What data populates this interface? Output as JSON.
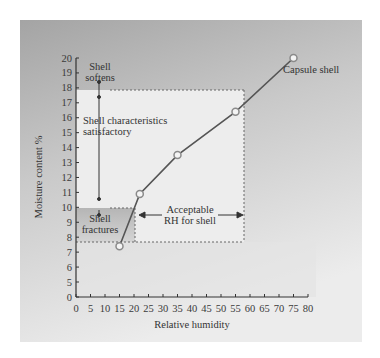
{
  "chart_data": {
    "type": "line",
    "title": "",
    "xlabel": "Relative humidity",
    "ylabel": "Moisture content %",
    "xlim": [
      0,
      80
    ],
    "ylim": [
      0,
      20
    ],
    "y_axis_break": "0 then 5-20",
    "x_ticks": [
      0,
      5,
      10,
      15,
      20,
      25,
      30,
      35,
      40,
      45,
      50,
      55,
      60,
      65,
      70,
      75,
      80
    ],
    "y_ticks": [
      0,
      5,
      6,
      7,
      8,
      9,
      10,
      11,
      12,
      13,
      14,
      15,
      16,
      17,
      18,
      19,
      20
    ],
    "grid": false,
    "series": [
      {
        "name": "Capsule shell",
        "x": [
          15,
          22,
          35,
          55,
          75
        ],
        "y": [
          7.4,
          10.9,
          13.5,
          16.4,
          20.0
        ]
      }
    ],
    "regions": [
      {
        "label": "Shell softens",
        "y_range": [
          17.8,
          20
        ]
      },
      {
        "label": "Shell characteristics satisfactory",
        "y_range": [
          10,
          17.8
        ]
      },
      {
        "label": "Shell fractures",
        "y_range": [
          7.6,
          10
        ]
      },
      {
        "label": "Acceptable RH for shell",
        "x_range": [
          20.5,
          58
        ]
      }
    ],
    "annotations": [
      "Shell softens",
      "Shell characteristics satisfactory",
      "Shell fractures",
      "Acceptable RH for shell",
      "Capsule shell"
    ]
  },
  "labels": {
    "xlabel": "Relative humidity",
    "ylabel": "Moisture content %",
    "shell_softens_1": "Shell",
    "shell_softens_2": "softens",
    "satisfactory_1": "Shell characteristics",
    "satisfactory_2": "satisfactory",
    "fractures_1": "Shell",
    "fractures_2": "fractures",
    "acceptable_1": "Acceptable",
    "acceptable_2": "RH for shell",
    "series_label": "Capsule shell"
  },
  "colors": {
    "panel_dark": "#a9a9a9",
    "panel_light": "#e6e6e6",
    "accept_region": "#efefef",
    "fracture_region": "#c2c2c2",
    "line": "#555555",
    "marker": "#9a9a9a"
  }
}
